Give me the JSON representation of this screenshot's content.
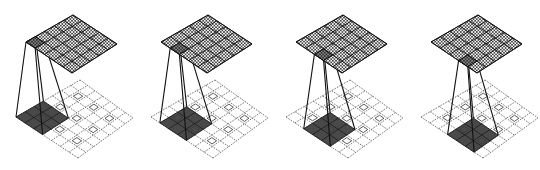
{
  "figure": {
    "description": "Transposed convolution (fractionally strided) illustration: 3x3 kernel sliding over a zero-inserted, padded input to produce a 5x5 output",
    "panel_count": 4
  },
  "colors": {
    "kernel_fill": "#3a3a3a",
    "grid_dashed": "#555555",
    "output_hatch": "#222222",
    "background": "#ffffff"
  },
  "layout": {
    "panel_offset_x": 135,
    "input": {
      "cells": 7,
      "left": [
        16,
        117
      ],
      "top": [
        80,
        80
      ],
      "right": [
        133,
        118
      ],
      "bottom": [
        78,
        158
      ]
    },
    "output": {
      "cells": 5,
      "left": [
        26,
        42
      ],
      "top": [
        73,
        15
      ],
      "right": [
        117,
        44
      ],
      "bottom": [
        72,
        73
      ]
    },
    "kernel_size": 3,
    "input_pixels": [
      [
        1,
        1
      ],
      [
        1,
        3
      ],
      [
        1,
        5
      ],
      [
        3,
        1
      ],
      [
        3,
        3
      ],
      [
        3,
        5
      ],
      [
        5,
        1
      ],
      [
        5,
        3
      ],
      [
        5,
        5
      ]
    ]
  },
  "panels": [
    {
      "label": "step-1",
      "kernel_pos": [
        0,
        0
      ],
      "output_cell": [
        0,
        0
      ]
    },
    {
      "label": "step-2",
      "kernel_pos": [
        0,
        1
      ],
      "output_cell": [
        0,
        1
      ]
    },
    {
      "label": "step-3",
      "kernel_pos": [
        0,
        2
      ],
      "output_cell": [
        0,
        2
      ]
    },
    {
      "label": "step-4",
      "kernel_pos": [
        0,
        3
      ],
      "output_cell": [
        0,
        3
      ]
    }
  ]
}
